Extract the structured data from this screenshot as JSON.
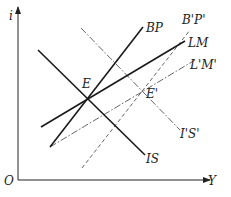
{
  "diagram": {
    "type": "IS-LM-BP model",
    "axes": {
      "y_label": "i",
      "x_label": "Y",
      "origin_label": "O"
    },
    "curves": [
      {
        "id": "IS",
        "label": "IS",
        "style": "solid"
      },
      {
        "id": "BP",
        "label": "BP",
        "style": "solid"
      },
      {
        "id": "LM",
        "label": "LM",
        "style": "solid"
      },
      {
        "id": "IpSp",
        "label": "I'S'",
        "style": "dash-dot"
      },
      {
        "id": "BpPp",
        "label": "B'P'",
        "style": "dashed"
      },
      {
        "id": "LpMp",
        "label": "L'M'",
        "style": "dash-dot"
      }
    ],
    "points": [
      {
        "id": "E",
        "label": "E"
      },
      {
        "id": "Ep",
        "label": "E'"
      }
    ],
    "colors": {
      "solid": "#1a1a1a",
      "dashed": "#555555"
    }
  }
}
